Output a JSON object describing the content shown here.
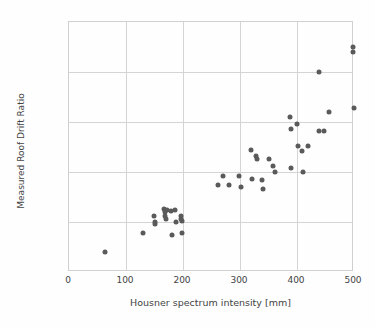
{
  "chart_data": {
    "type": "scatter",
    "title": "",
    "xlabel": "Housner spectrum intensity [mm]",
    "ylabel": "Measured Roof Drift Ratio",
    "xlim": [
      0,
      500
    ],
    "ylim": [
      0,
      5
    ],
    "xticks": [
      0,
      100,
      200,
      300,
      400,
      500
    ],
    "yticks": [
      0,
      1,
      2,
      3,
      4,
      5
    ],
    "xtick_labels": [
      "0",
      "100",
      "200",
      "300",
      "400",
      "500"
    ],
    "ytick_labels": [
      "0.0%",
      "1.0%",
      "2.0%",
      "3.0%",
      "4.0%",
      "5.0%"
    ],
    "grid": true,
    "legend": "none",
    "marker_color": "#5a5a5a",
    "grid_color": "#d4d4d4",
    "series": [
      {
        "name": "Measured roof drift ratio vs Housner spectrum intensity",
        "points": [
          [
            63,
            0.4
          ],
          [
            130,
            0.78
          ],
          [
            149,
            1.12
          ],
          [
            150,
            1.0
          ],
          [
            151,
            0.96
          ],
          [
            167,
            1.26
          ],
          [
            168,
            1.2
          ],
          [
            169,
            1.12
          ],
          [
            170,
            1.06
          ],
          [
            172,
            1.24
          ],
          [
            179,
            1.23
          ],
          [
            180,
            0.74
          ],
          [
            186,
            1.24
          ],
          [
            187,
            1.0
          ],
          [
            196,
            1.12
          ],
          [
            197,
            1.06
          ],
          [
            198,
            1.02
          ],
          [
            199,
            0.78
          ],
          [
            262,
            1.74
          ],
          [
            271,
            1.92
          ],
          [
            281,
            1.74
          ],
          [
            299,
            1.92
          ],
          [
            301,
            1.7
          ],
          [
            319,
            2.44
          ],
          [
            321,
            1.87
          ],
          [
            328,
            2.33
          ],
          [
            330,
            2.27
          ],
          [
            339,
            1.84
          ],
          [
            341,
            1.66
          ],
          [
            350,
            2.26
          ],
          [
            358,
            2.13
          ],
          [
            361,
            2.0
          ],
          [
            388,
            3.1
          ],
          [
            389,
            2.87
          ],
          [
            389,
            2.09
          ],
          [
            400,
            2.97
          ],
          [
            401,
            2.53
          ],
          [
            408,
            2.43
          ],
          [
            410,
            2.0
          ],
          [
            420,
            2.53
          ],
          [
            438,
            4.0
          ],
          [
            438,
            2.83
          ],
          [
            447,
            2.83
          ],
          [
            457,
            3.2
          ],
          [
            499,
            4.5
          ],
          [
            499,
            4.4
          ],
          [
            500,
            3.28
          ]
        ]
      }
    ]
  }
}
